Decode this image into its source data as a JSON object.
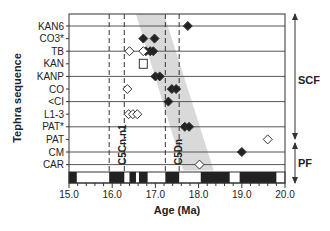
{
  "chart_data": {
    "type": "scatter",
    "title": "",
    "xlabel": "Age (Ma)",
    "ylabel": "Tephra sequence",
    "xlim": [
      15.0,
      20.0
    ],
    "x_ticks": [
      "15.0",
      "16.0",
      "17.0",
      "18.0",
      "19.0",
      "20.0"
    ],
    "categories": [
      "KAN6",
      "CO3*",
      "TB",
      "KAN",
      "KANP",
      "CO",
      "<CI",
      "L1-3",
      "PAT*",
      "PAT",
      "CM",
      "CAR"
    ],
    "grid_rows": [
      "KAN6",
      "TB",
      "KANP",
      "<CI",
      "PAT*",
      "CM",
      "CAR"
    ],
    "series": [
      {
        "name": "filled diamonds",
        "marker": "diamond-filled",
        "points": [
          {
            "y": "KAN6",
            "x": 17.75
          },
          {
            "y": "CO3*",
            "x": 16.72
          },
          {
            "y": "CO3*",
            "x": 16.98
          },
          {
            "y": "TB",
            "x": 16.78
          },
          {
            "y": "TB",
            "x": 16.88
          },
          {
            "y": "TB",
            "x": 16.95
          },
          {
            "y": "KANP",
            "x": 17.0
          },
          {
            "y": "KANP",
            "x": 17.1
          },
          {
            "y": "CO",
            "x": 17.38
          },
          {
            "y": "CO",
            "x": 17.48
          },
          {
            "y": "<CI",
            "x": 17.3
          },
          {
            "y": "PAT*",
            "x": 17.68
          },
          {
            "y": "PAT*",
            "x": 17.78
          },
          {
            "y": "CM",
            "x": 19.0
          }
        ]
      },
      {
        "name": "open diamonds",
        "marker": "diamond-open",
        "points": [
          {
            "y": "TB",
            "x": 16.4
          },
          {
            "y": "TB",
            "x": 16.72
          },
          {
            "y": "CO",
            "x": 16.35
          },
          {
            "y": "L1-3",
            "x": 16.38
          },
          {
            "y": "L1-3",
            "x": 16.48
          },
          {
            "y": "L1-3",
            "x": 16.58
          },
          {
            "y": "PAT",
            "x": 19.6
          },
          {
            "y": "CAR",
            "x": 18.02
          }
        ]
      },
      {
        "name": "open squares",
        "marker": "square-open",
        "points": [
          {
            "y": "KAN",
            "x": 16.72
          }
        ]
      }
    ],
    "dashed_lines": [
      {
        "x": 15.93,
        "label": ""
      },
      {
        "x": 16.28,
        "label": "C5Cn.n1"
      },
      {
        "x": 17.23,
        "label": ""
      },
      {
        "x": 17.55,
        "label": "C5Dn"
      }
    ],
    "shaded_band": {
      "description": "grey trend band sloping from upper-left to lower-right",
      "top": {
        "y": "KAN6",
        "x_from": 16.55,
        "x_to": 17.2
      },
      "bottom": {
        "y": "CAR",
        "x_from": 17.65,
        "x_to": 18.35
      }
    },
    "polarity_bar": {
      "normal_intervals": [
        [
          15.0,
          15.18
        ],
        [
          15.93,
          16.28
        ],
        [
          16.4,
          16.55
        ],
        [
          16.62,
          16.82
        ],
        [
          17.23,
          17.55
        ],
        [
          18.05,
          18.72
        ],
        [
          18.95,
          19.8
        ]
      ],
      "colors": {
        "normal": "#222222",
        "reversed": "#ffffff"
      }
    },
    "groups": [
      {
        "label": "SCF",
        "from": "KAN6",
        "to": "PAT"
      },
      {
        "label": "PF",
        "from": "PAT",
        "to": "CAR"
      }
    ],
    "grid": "horizontal lines on every other row",
    "legend": "none"
  },
  "labels": {
    "y_axis": "Tephra sequence",
    "x_axis": "Age (Ma)",
    "group_scf": "SCF",
    "group_pf": "PF",
    "chron_1": "C5Cn.n1",
    "chron_2": "C5Dn"
  },
  "colors": {
    "band": "#d9d9d9",
    "line": "#555555",
    "marker": "#222222"
  }
}
